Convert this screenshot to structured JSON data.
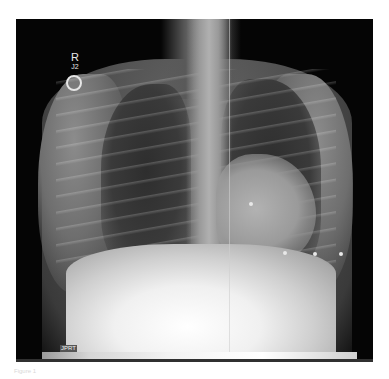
{
  "image": {
    "type": "chest-xray-pa",
    "markers": {
      "side_marker": "R",
      "side_marker_sub": "J2"
    },
    "strip_label": "JPRT",
    "caption": "Figure 1"
  }
}
